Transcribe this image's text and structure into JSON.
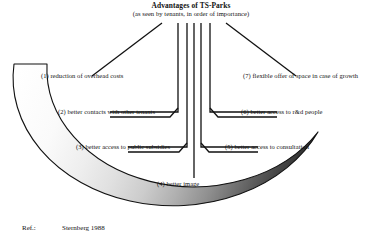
{
  "figure": {
    "title": {
      "main": "Advantages of TS-Parks",
      "subtitle": "(as seen by tenants, in order of importance)"
    },
    "advantages": [
      {
        "number": "(1)",
        "text": "(1) reduction of overhead costs"
      },
      {
        "number": "(2)",
        "text": "(2) better contacts with other tenants"
      },
      {
        "number": "(3)",
        "text": "(3) better access to public subsidies"
      },
      {
        "number": "(4)",
        "text": "(4) better image"
      },
      {
        "number": "(5)",
        "text": "(5) better access to consultation"
      },
      {
        "number": "(6)",
        "text": "(6) better access to r&d people"
      },
      {
        "number": "(7)",
        "text": "(7) flexible offer of space in case of growth"
      }
    ],
    "reference": {
      "label": "Ref.:",
      "source": "Sternberg 1988"
    },
    "colors": {
      "outline": "#111111",
      "background": "#ffffff",
      "arc_light": "#ffffff",
      "arc_step1": "#efefef",
      "arc_step2": "#e2e2e2",
      "arc_step3": "#d0d0d0",
      "arc_step4": "#b8b8b8",
      "arc_step5": "#9a9a9a",
      "arc_step6": "#6f6f6f",
      "arc_step7": "#3c3c3c",
      "arc_dark": "#111111"
    }
  }
}
